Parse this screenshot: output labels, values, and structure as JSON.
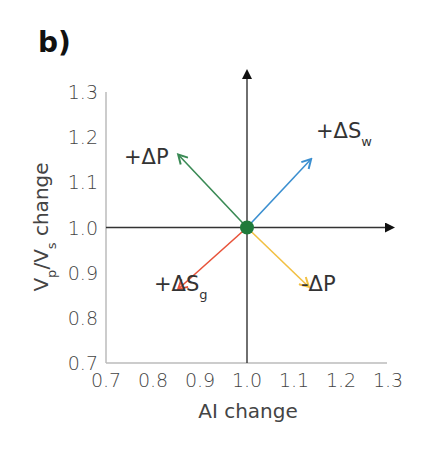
{
  "panel_label": "b)",
  "chart_data": {
    "type": "vector",
    "title": "",
    "xlabel": "AI change",
    "ylabel": "Vp/Vs change",
    "ylabel_parts": {
      "V1": "V",
      "sub1": "p",
      "slash": "/V",
      "sub2": "s",
      "rest": " change"
    },
    "xlim": [
      0.7,
      1.3
    ],
    "ylim": [
      0.7,
      1.3
    ],
    "x_ticks": [
      "0.7",
      "0.8",
      "0.9",
      "1.0",
      "1.1",
      "1.2",
      "1.3"
    ],
    "y_ticks": [
      "0.7",
      "0.8",
      "0.9",
      "1.0",
      "1.1",
      "1.2",
      "1.3"
    ],
    "origin": {
      "x": 1.0,
      "y": 1.0,
      "color": "#1f7a3a"
    },
    "grid": false,
    "vectors": [
      {
        "name": "+ΔP",
        "label_main": "+ΔP",
        "label_sub": "",
        "from": [
          1.0,
          1.0
        ],
        "to": [
          0.855,
          1.16
        ],
        "color": "#3a8a55"
      },
      {
        "name": "+ΔSw",
        "label_main": "+ΔS",
        "label_sub": "w",
        "from": [
          1.0,
          1.0
        ],
        "to": [
          1.135,
          1.15
        ],
        "color": "#3b8fd0"
      },
      {
        "name": "+ΔSg",
        "label_main": "+ΔS",
        "label_sub": "g",
        "from": [
          1.0,
          1.0
        ],
        "to": [
          0.855,
          0.865
        ],
        "color": "#e8533a"
      },
      {
        "name": "-ΔP",
        "label_main": "-ΔP",
        "label_sub": "",
        "from": [
          1.0,
          1.0
        ],
        "to": [
          1.13,
          0.87
        ],
        "color": "#f2c042"
      }
    ]
  }
}
